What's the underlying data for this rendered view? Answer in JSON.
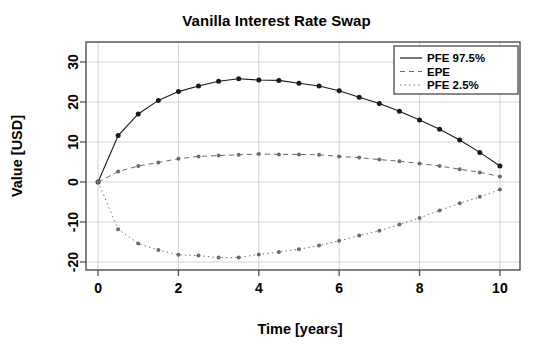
{
  "chart_data": {
    "type": "line",
    "title": "Vanilla Interest Rate Swap",
    "xlabel": "Time [years]",
    "ylabel": "Value [USD]",
    "xlim": [
      -0.3,
      10.5
    ],
    "ylim": [
      -22,
      35
    ],
    "xticks": [
      0,
      2,
      4,
      6,
      8,
      10
    ],
    "xtick_labels": [
      "0",
      "2",
      "4",
      "6",
      "8",
      "10"
    ],
    "yticks": [
      -20,
      -10,
      0,
      10,
      20,
      30
    ],
    "ytick_labels": [
      "-20",
      "-10",
      "0",
      "10",
      "20",
      "30"
    ],
    "grid": true,
    "legend_position": "top-right",
    "x": [
      0,
      0.5,
      1,
      1.5,
      2,
      2.5,
      3,
      3.5,
      4,
      4.5,
      5,
      5.5,
      6,
      6.5,
      7,
      7.5,
      8,
      8.5,
      9,
      9.5,
      10
    ],
    "series": [
      {
        "name": "PFE 97.5%",
        "style": "solid",
        "color": "#1a1a1a",
        "marker": "circle",
        "values": [
          0,
          11.6,
          17.0,
          20.4,
          22.6,
          24.0,
          25.2,
          25.8,
          25.5,
          25.4,
          24.7,
          24.0,
          22.8,
          21.2,
          19.6,
          17.7,
          15.5,
          13.2,
          10.5,
          7.4,
          4.0
        ]
      },
      {
        "name": "EPE",
        "style": "dashed",
        "color": "#6b6b6b",
        "marker": "circle",
        "values": [
          0,
          2.6,
          4.0,
          4.9,
          5.8,
          6.4,
          6.6,
          6.8,
          7.0,
          6.9,
          6.9,
          6.8,
          6.4,
          6.1,
          5.6,
          5.2,
          4.6,
          4.0,
          3.2,
          2.4,
          1.4
        ]
      },
      {
        "name": "PFE 2.5%",
        "style": "dotted",
        "color": "#6b6b6b",
        "marker": "circle",
        "values": [
          0,
          -11.8,
          -15.4,
          -17.0,
          -18.2,
          -18.4,
          -18.9,
          -18.9,
          -18.1,
          -17.5,
          -16.8,
          -15.9,
          -14.7,
          -13.4,
          -12.2,
          -10.6,
          -9.0,
          -7.1,
          -5.3,
          -3.7,
          -1.9
        ]
      }
    ]
  },
  "legend": {
    "entries": [
      {
        "label": "PFE 97.5%"
      },
      {
        "label": "EPE"
      },
      {
        "label": "PFE 2.5%"
      }
    ]
  }
}
